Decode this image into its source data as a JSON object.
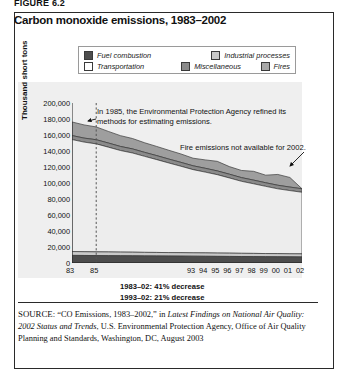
{
  "figure_label": "FIGURE 6.2",
  "title": "Carbon monoxide emissions, 1983–2002",
  "legend": {
    "items": [
      {
        "label": "Fuel combustion",
        "swatch": "dark-gray-swatch",
        "color": "#4d4d4d"
      },
      {
        "label": "Industrial processes",
        "swatch": "light-gray-swatch",
        "color": "#c9c9c9"
      },
      {
        "label": "Transportation",
        "swatch": "white-swatch",
        "color": "#ffffff"
      },
      {
        "label": "Miscellaneous",
        "swatch": "medium-gray-swatch",
        "color": "#8a8a8a"
      },
      {
        "label": "Fires",
        "swatch": "gray-swatch",
        "color": "#a8a8a8"
      }
    ]
  },
  "annotations": [
    {
      "name": "epa-methods-note",
      "text": "In 1985, the Environmental Protection Agency refined its methods for estimating emissions."
    },
    {
      "name": "fires-2002-note",
      "text": "Fire emissions not available for 2002."
    }
  ],
  "statistics": [
    "1983–02: 41% decrease",
    "1993–02: 21% decrease"
  ],
  "source": {
    "label": "SOURCE:",
    "text": " “CO Emissions, 1983–2002,” in ",
    "italic1": "Latest Findings on National Air Quality: 2002 Status and Trends",
    "text2": ", U.S. Environmental Protection Agency, Office of Air Quality Planning and Standards, Washington, DC, August 2003"
  },
  "chart_data": {
    "type": "area",
    "title": "Carbon monoxide emissions, 1983–2002",
    "xlabel": "",
    "ylabel": "Thousand short tons",
    "ylim": [
      0,
      200000
    ],
    "ytick_labels": [
      "200,000",
      "180,000",
      "160,000",
      "140,000",
      "120,000",
      "100,000",
      "80,000",
      "60,000",
      "40,000",
      "20,000",
      "0"
    ],
    "ytick_values": [
      200000,
      180000,
      160000,
      140000,
      120000,
      100000,
      80000,
      60000,
      40000,
      20000,
      0
    ],
    "xtick_labels": [
      "83",
      "85",
      "93",
      "94",
      "95",
      "96",
      "97",
      "98",
      "99",
      "00",
      "01",
      "02"
    ],
    "xtick_values": [
      1983,
      1985,
      1993,
      1994,
      1995,
      1996,
      1997,
      1998,
      1999,
      2000,
      2001,
      2002
    ],
    "x": [
      1983,
      1984,
      1985,
      1986,
      1987,
      1988,
      1989,
      1990,
      1991,
      1992,
      1993,
      1994,
      1995,
      1996,
      1997,
      1998,
      1999,
      2000,
      2001,
      2002
    ],
    "stacked": true,
    "grid": false,
    "legend_position": "top",
    "reference_line": {
      "x": 1985,
      "style": "dashed",
      "label": "1985 EPA method change"
    },
    "series": [
      {
        "name": "Fuel combustion",
        "color": "#4d4d4d",
        "values": [
          9500,
          9400,
          9300,
          9200,
          9100,
          9000,
          8900,
          8800,
          8700,
          8600,
          8500,
          8400,
          8300,
          8200,
          8100,
          8000,
          7900,
          7800,
          7700,
          7600
        ]
      },
      {
        "name": "Industrial processes",
        "color": "#c9c9c9",
        "values": [
          4800,
          4700,
          4600,
          4600,
          4500,
          4500,
          4400,
          4400,
          4300,
          4300,
          4200,
          4200,
          4100,
          4100,
          4000,
          4000,
          3900,
          3900,
          3800,
          3800
        ]
      },
      {
        "name": "Transportation",
        "color": "#ededed",
        "values": [
          140000,
          137000,
          135000,
          131000,
          127000,
          124000,
          120000,
          116000,
          112000,
          108000,
          104000,
          101000,
          98000,
          94000,
          90000,
          87000,
          84000,
          81000,
          79000,
          77000
        ]
      },
      {
        "name": "Miscellaneous",
        "color": "#8a8a8a",
        "values": [
          5000,
          5000,
          5200,
          5200,
          5100,
          5100,
          5000,
          5000,
          4900,
          4900,
          4800,
          4800,
          4700,
          4700,
          4600,
          4600,
          4500,
          4500,
          4400,
          4400
        ]
      },
      {
        "name": "Fires",
        "color": "#9e9e9e",
        "values": [
          17000,
          16500,
          16000,
          14500,
          13500,
          13000,
          12000,
          11500,
          11000,
          10500,
          9500,
          10500,
          12000,
          9500,
          9000,
          11000,
          9500,
          13500,
          12000,
          0
        ]
      }
    ],
    "totals": [
      176300,
      172600,
      170100,
      164500,
      159200,
      155600,
      150300,
      145700,
      140900,
      136300,
      131000,
      128900,
      127100,
      120500,
      115700,
      114600,
      109800,
      110700,
      106900,
      92800
    ]
  }
}
